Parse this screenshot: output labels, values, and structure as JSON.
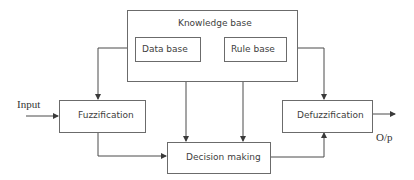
{
  "diagram": {
    "type": "fuzzy-inference-system-block-diagram",
    "blocks": {
      "knowledge_base": "Knowledge base",
      "data_base": "Data base",
      "rule_base": "Rule base",
      "fuzzification": "Fuzzification",
      "decision_making": "Decision making",
      "defuzzification": "Defuzzification"
    },
    "io": {
      "input": "Input",
      "output": "O/p"
    },
    "edges": [
      {
        "from": "input",
        "to": "fuzzification"
      },
      {
        "from": "knowledge_base",
        "to": "fuzzification"
      },
      {
        "from": "knowledge_base",
        "to": "defuzzification"
      },
      {
        "from": "data_base",
        "to": "decision_making"
      },
      {
        "from": "rule_base",
        "to": "decision_making"
      },
      {
        "from": "fuzzification",
        "to": "decision_making"
      },
      {
        "from": "decision_making",
        "to": "defuzzification"
      },
      {
        "from": "defuzzification",
        "to": "output"
      }
    ],
    "line_color": "#4a4a4a"
  }
}
